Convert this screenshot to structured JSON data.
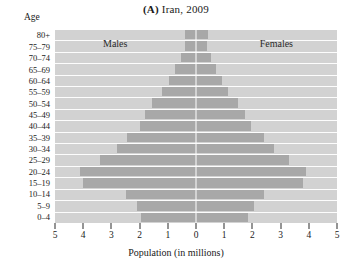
{
  "figure": {
    "title_tag": "(A)",
    "title_text": " Iran, 2009",
    "age_header": "Age",
    "males_label": "Males",
    "females_label": "Females",
    "xlabel": "Population (in millions)",
    "bar_color": "#a8a8a8",
    "panel_color": "#d2d2d2",
    "gridline_color": "#fdfdfd"
  },
  "chart_data": {
    "type": "bar",
    "subtype": "population-pyramid",
    "title": "(A) Iran, 2009",
    "xlabel": "Population (in millions)",
    "ylabel": "Age",
    "orientation": "horizontal",
    "xlim": [
      -5,
      5
    ],
    "xticks": [
      -5,
      -4,
      -3,
      -2,
      -1,
      0,
      1,
      2,
      3,
      4,
      5
    ],
    "xtick_labels": [
      "5",
      "4",
      "3",
      "2",
      "1",
      "0",
      "1",
      "2",
      "3",
      "4",
      "5"
    ],
    "grid": true,
    "legend": [
      "Males",
      "Females"
    ],
    "legend_position": "inside-top",
    "categories": [
      "80+",
      "75–79",
      "70–74",
      "65–69",
      "60–64",
      "55–59",
      "50–54",
      "45–49",
      "40–44",
      "35–39",
      "30–34",
      "25–29",
      "20–24",
      "15–19",
      "10–14",
      "5–9",
      "0–4"
    ],
    "series": [
      {
        "name": "Males",
        "side": "left",
        "values": [
          0.4,
          0.4,
          0.55,
          0.75,
          0.95,
          1.2,
          1.55,
          1.8,
          2.0,
          2.45,
          2.8,
          3.4,
          4.1,
          4.0,
          2.5,
          2.1,
          1.95
        ]
      },
      {
        "name": "Females",
        "side": "right",
        "values": [
          0.42,
          0.4,
          0.52,
          0.72,
          0.92,
          1.15,
          1.5,
          1.75,
          1.95,
          2.4,
          2.75,
          3.3,
          3.9,
          3.8,
          2.4,
          2.05,
          1.85
        ]
      }
    ]
  }
}
